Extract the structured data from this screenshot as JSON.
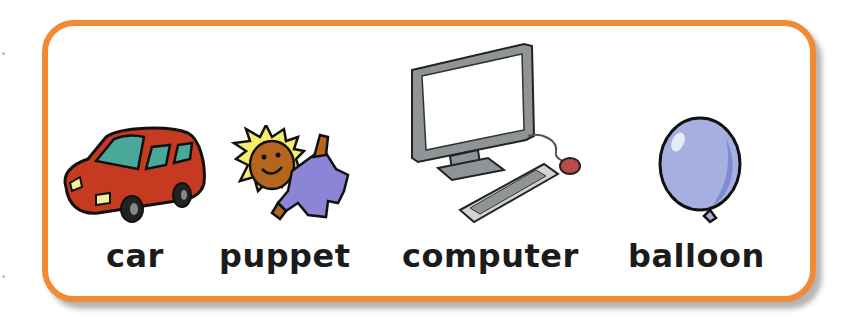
{
  "card": {
    "border_color": "#f28a35",
    "items": [
      {
        "label": "car",
        "icon": "car-icon"
      },
      {
        "label": "puppet",
        "icon": "puppet-icon"
      },
      {
        "label": "computer",
        "icon": "computer-icon"
      },
      {
        "label": "balloon",
        "icon": "balloon-icon"
      }
    ]
  }
}
